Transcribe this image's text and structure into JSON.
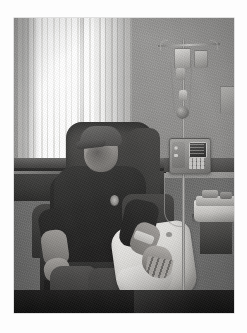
{
  "page": {
    "background_color": "#fdfdfd",
    "type": "photograph"
  },
  "photo": {
    "alt_text": "Elderly man wearing a baseball cap seated in a dark recliner chair receiving intravenous infusion therapy in a clinic treatment room",
    "caption": "",
    "palette": {
      "wall": "#a2a09b",
      "blinds_light": "#ffffff",
      "chair_dark": "#3a3835",
      "pillow_white": "#efece4",
      "floor_dark": "#1a1917",
      "pole_metal": "#b9b6ae"
    },
    "scene_elements": [
      {
        "name": "window-blinds",
        "label": "Vertical window blinds",
        "note": "bright daylight behind"
      },
      {
        "name": "window-sill",
        "label": "Dark window sill / counter ledge"
      },
      {
        "name": "recliner-chair",
        "label": "Dark upholstered recliner chair"
      },
      {
        "name": "patient",
        "label": "Seated man in baseball cap and dark short-sleeve shirt"
      },
      {
        "name": "baseball-cap",
        "label": "Grey baseball cap"
      },
      {
        "name": "shirt-emblem",
        "label": "Small light emblem on shirt chest"
      },
      {
        "name": "lap-pillow",
        "label": "White pillow supporting the right arm"
      },
      {
        "name": "iv-site-tape",
        "label": "Tape securing IV line at forearm"
      },
      {
        "name": "iv-pole",
        "label": "Stainless IV pole"
      },
      {
        "name": "iv-bag-primary",
        "label": "Primary IV fluid bag"
      },
      {
        "name": "iv-bag-secondary",
        "label": "Secondary IV fluid bag"
      },
      {
        "name": "drip-chamber",
        "label": "Drip chamber"
      },
      {
        "name": "roller-clamp",
        "label": "Inline roller / ball valve"
      },
      {
        "name": "infusion-pump",
        "label": "Electronic infusion pump with display and keypad"
      },
      {
        "name": "pump-display",
        "label": "Pump LCD display"
      },
      {
        "name": "pump-keypad",
        "label": "Pump keypad buttons"
      },
      {
        "name": "side-table",
        "label": "Side table with cloth and supplies"
      },
      {
        "name": "wall-poster",
        "label": "Small framed item on right wall"
      },
      {
        "name": "floor",
        "label": "Dark tiled floor"
      }
    ]
  }
}
